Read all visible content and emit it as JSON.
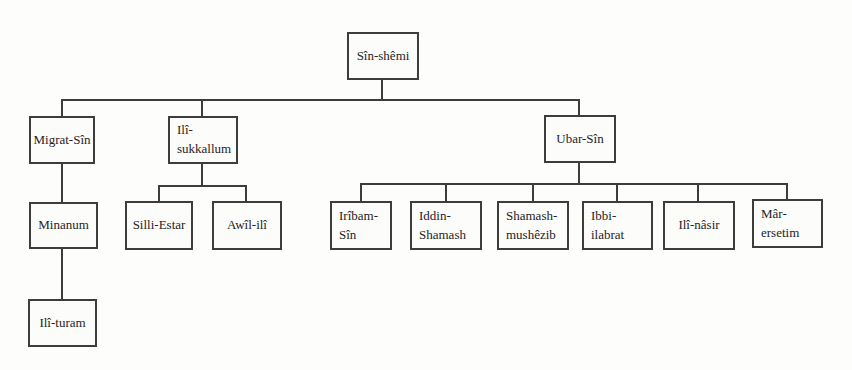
{
  "diagram": {
    "type": "genealogy-tree",
    "root_label": "Sîn-shêmi",
    "line_color": "#3d3d3d",
    "box_background": "#fcfcfb",
    "page_background": "#fdfdfc"
  },
  "nodes": {
    "sin_shemi": {
      "label": "Sîn-shêmi"
    },
    "migrat_sin": {
      "label": "Migrat-Sîn"
    },
    "ili_sukkallum": {
      "label": "Ilî-sukkallum"
    },
    "ubar_sin": {
      "label": "Ubar-Sîn"
    },
    "minanum": {
      "label": "Minanum"
    },
    "ili_turam": {
      "label": "Ilî-turam"
    },
    "silli_estar": {
      "label": "Silli-Estar"
    },
    "awil_ili": {
      "label": "Awîl-ilî"
    },
    "iribam_sin": {
      "label": "Irîbam-Sîn"
    },
    "iddin_shamash": {
      "label": "Iddin-Shamash"
    },
    "shamash_mushezib": {
      "label": "Shamash-mushêzib"
    },
    "ibbi_ilabrat": {
      "label": "Ibbi-ilabrat"
    },
    "ili_nasir": {
      "label": "Ilî-nâsir"
    },
    "mar_ersetim": {
      "label": "Mâr-ersetim"
    }
  },
  "edges": [
    [
      "Sîn-shêmi",
      "Migrat-Sîn"
    ],
    [
      "Sîn-shêmi",
      "Ilî-sukkallum"
    ],
    [
      "Sîn-shêmi",
      "Ubar-Sîn"
    ],
    [
      "Migrat-Sîn",
      "Minanum"
    ],
    [
      "Minanum",
      "Ilî-turam"
    ],
    [
      "Ilî-sukkallum",
      "Silli-Estar"
    ],
    [
      "Ilî-sukkallum",
      "Awîl-ilî"
    ],
    [
      "Ubar-Sîn",
      "Irîbam-Sîn"
    ],
    [
      "Ubar-Sîn",
      "Iddin-Shamash"
    ],
    [
      "Ubar-Sîn",
      "Shamash-mushêzib"
    ],
    [
      "Ubar-Sîn",
      "Ibbi-ilabrat"
    ],
    [
      "Ubar-Sîn",
      "Ilî-nâsir"
    ],
    [
      "Ubar-Sîn",
      "Mâr-ersetim"
    ]
  ]
}
